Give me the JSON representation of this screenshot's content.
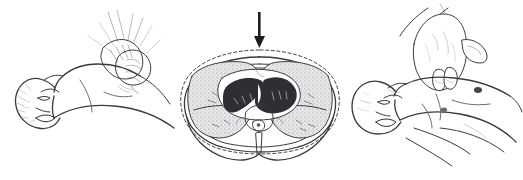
{
  "figure": {
    "background_color": "#ffffff",
    "ink_color": "#3a3a42",
    "style": "grayscale pen-and-ink medical line drawing",
    "panel_count": 3,
    "has_text_labels": false,
    "width": 523,
    "height": 180
  },
  "panels": [
    {
      "id": "adult",
      "position": "left",
      "caption": "Adult chest compression with two interlocked hands on lower sternum",
      "subject": "adult patient supine, head turned toward viewer, mouth open, head tilted back",
      "hand_technique": "two-hands-interlocked",
      "hand_count": 2,
      "contact_point": "lower half of sternum",
      "rescuer_visible_parts": "both hands and forearms entering from upper right",
      "parts": [
        "head",
        "face",
        "open-mouth",
        "ear",
        "hair",
        "neck",
        "shoulder",
        "chest",
        "torso",
        "arm",
        "rescuer-left-hand",
        "rescuer-right-hand",
        "rescuer-forearms"
      ]
    },
    {
      "id": "cross-section",
      "position": "center",
      "caption": "Transverse cross-section of the thorax showing chest wall displacement during compression",
      "subject": "axial CT-style anatomical slice at heart level",
      "compression_arrows": 2,
      "arrow_direction": "downward",
      "arrow_color": "#1d1d22",
      "outline_relaxed": "dashed",
      "outline_compressed": "solid",
      "anatomy": [
        {
          "name": "chest-wall",
          "rendering": "double contour line"
        },
        {
          "name": "sternum",
          "rendering": "flattened bar at anterior midline"
        },
        {
          "name": "heart",
          "rendering": "dark filled mass with two chambers and septum"
        },
        {
          "name": "pericardial-space",
          "rendering": "white ring surrounding heart"
        },
        {
          "name": "left-lung",
          "rendering": "stippled grey field"
        },
        {
          "name": "right-lung",
          "rendering": "stippled grey field"
        },
        {
          "name": "vertebral-body",
          "rendering": "pale oval at posterior midline"
        },
        {
          "name": "spinal-canal",
          "rendering": "small dark ring within vertebra"
        },
        {
          "name": "spinous-process",
          "rendering": "narrow projection extending posteriorly"
        },
        {
          "name": "posterior-back-contour",
          "rendering": "wide lower outline"
        }
      ]
    },
    {
      "id": "infant",
      "position": "right",
      "caption": "Infant chest compression using two fingers on the sternum",
      "subject": "infant supine, head turned toward viewer, mouth open",
      "hand_technique": "two-fingers",
      "hand_count": 1,
      "finger_count": 2,
      "contact_point": "sternum just below nipple line",
      "rescuer_visible_parts": "one hand and wrist entering from top",
      "parts": [
        "head",
        "face",
        "open-mouth",
        "ear",
        "neck",
        "shoulder",
        "chest",
        "nipples",
        "abdomen",
        "arm",
        "rescuer-hand",
        "rescuer-index-finger",
        "rescuer-middle-finger",
        "rescuer-wrist"
      ]
    }
  ]
}
